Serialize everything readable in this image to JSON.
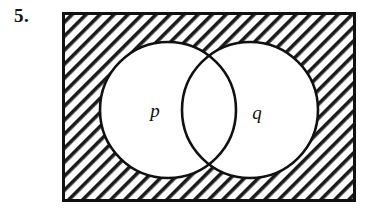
{
  "figure": {
    "problem_number": "5.",
    "type": "venn-diagram",
    "universal_set": {
      "shape": "rectangle",
      "shaded": true,
      "hatch_pattern": "diagonal-45",
      "border_color": "#111111",
      "fill_color": "#ffffff"
    },
    "sets": [
      {
        "label": "p",
        "position": "left",
        "shaded": false,
        "fill_color": "#ffffff",
        "stroke_color": "#111111"
      },
      {
        "label": "q",
        "position": "right",
        "shaded": false,
        "fill_color": "#ffffff",
        "stroke_color": "#111111"
      }
    ],
    "colors": {
      "ink": "#111111",
      "paper": "#ffffff",
      "hatch": "#1a1a1a"
    }
  }
}
